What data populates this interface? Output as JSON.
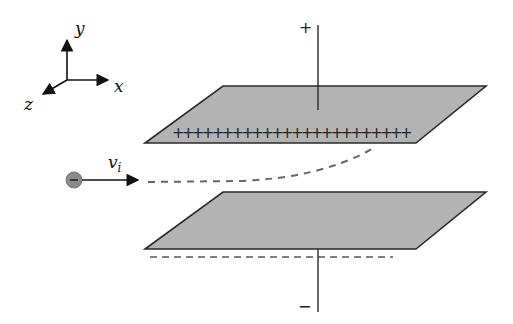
{
  "diagram": {
    "axes": {
      "x_label": "x",
      "y_label": "y",
      "z_label": "z"
    },
    "particle": {
      "charge_symbol": "−",
      "fill_color": "#8a8a8a",
      "velocity_label": "v",
      "velocity_subscript": "i"
    },
    "top_plate": {
      "terminal_label": "+",
      "charge_marks": "++++++++++++++++++++++++",
      "charge_count": 24,
      "fill_color": "#b3b3b3"
    },
    "bottom_plate": {
      "terminal_label": "−",
      "charge_marks": "dashed line of negative charges",
      "fill_color": "#b3b3b3"
    },
    "trajectory": {
      "style": "dashed",
      "description": "path curves upward toward positive plate"
    }
  }
}
